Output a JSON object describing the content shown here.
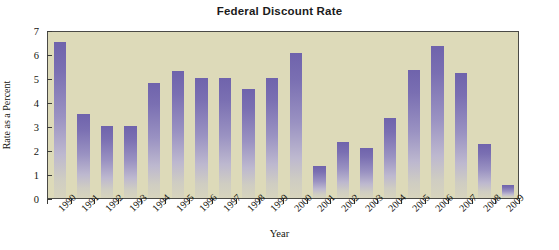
{
  "chart_data": {
    "type": "bar",
    "title": "Federal Discount Rate",
    "xlabel": "Year",
    "ylabel": "Rate as a Percent",
    "categories": [
      "1990",
      "1991",
      "1992",
      "1993",
      "1994",
      "1995",
      "1996",
      "1997",
      "1998",
      "1999",
      "2000",
      "2001",
      "2002",
      "2003",
      "2004",
      "2005",
      "2006",
      "2007",
      "2008",
      "2009"
    ],
    "values": [
      6.5,
      3.5,
      3.0,
      3.0,
      4.8,
      5.3,
      5.0,
      5.0,
      4.55,
      5.0,
      6.05,
      1.35,
      2.35,
      2.1,
      3.35,
      5.35,
      6.35,
      5.2,
      2.25,
      0.55
    ],
    "ylim": [
      0,
      7
    ],
    "yticks": [
      0,
      1,
      2,
      3,
      4,
      5,
      6,
      7
    ],
    "ytick_labels": [
      "0",
      "1",
      "2",
      "3",
      "4",
      "5",
      "6",
      "7"
    ],
    "grid": false,
    "legend": "none",
    "series": [
      {
        "name": "Federal Discount Rate",
        "values": [
          6.5,
          3.5,
          3.0,
          3.0,
          4.8,
          5.3,
          5.0,
          5.0,
          4.55,
          5.0,
          6.05,
          1.35,
          2.35,
          2.1,
          3.35,
          5.35,
          6.35,
          5.2,
          2.25,
          0.55
        ]
      }
    ],
    "colors": {
      "plot_background": "#dddab9",
      "bar_top": "#6f63ac",
      "bar_bottom": "#d7d4bd",
      "axis": "#3d3d3a",
      "text": "#15150f",
      "page_background": "#ffffff"
    }
  }
}
